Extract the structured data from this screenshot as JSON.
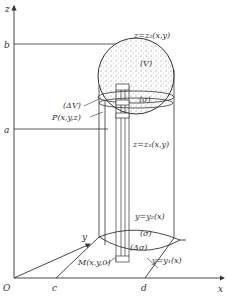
{
  "diagram": {
    "type": "triple-integral-region",
    "axes": {
      "x": "x",
      "y": "y",
      "z": "z",
      "origin": "O"
    },
    "ticks": {
      "z_upper": "b",
      "z_lower": "a",
      "x_left": "c",
      "x_right": "d"
    },
    "labels": {
      "upper_surface": "z=z₂(x,y)",
      "lower_surface": "z=z₁(x,y)",
      "region_V": "(V)",
      "volume_element": "(ΔV)",
      "point_P": "P(x,y,z)",
      "point_M": "M(x,y,0)",
      "region_sigma": "(σ)",
      "region_sigma_slice": "(σ)",
      "area_element": "(Δσ)",
      "curve_y2": "y=y₂(x)",
      "curve_y1": "y=y₁(x)"
    },
    "colors": {
      "ink": "#333333",
      "fill_stipple": "#9a9a9a",
      "background": "#ffffff"
    }
  }
}
